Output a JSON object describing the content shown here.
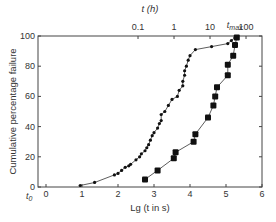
{
  "chart_data": {
    "type": "scatter",
    "title": "",
    "xlabel": "Lg (t in s)",
    "ylabel": "Cumulative percentage failure",
    "top_axis_label": "t (h)",
    "top_axis_ticks": [
      {
        "label": "0.1",
        "lg_s": 2.556
      },
      {
        "label": "1",
        "lg_s": 3.556
      },
      {
        "label": "10",
        "lg_s": 4.556
      },
      {
        "label": "100",
        "lg_s": 5.556
      }
    ],
    "annotations": [
      {
        "text": "t_max",
        "x": 5.3,
        "y": 100
      },
      {
        "text": "t_0",
        "x": 0,
        "y": 0
      }
    ],
    "xlim": [
      0,
      6
    ],
    "ylim": [
      0,
      100
    ],
    "x_ticks": [
      0,
      1,
      2,
      3,
      4,
      5,
      6
    ],
    "y_ticks": [
      0,
      20,
      40,
      60,
      80,
      100
    ],
    "grid": false,
    "legend": null,
    "series": [
      {
        "name": "small dots",
        "marker": "small-circle",
        "x": [
          0.95,
          1.35,
          1.9,
          2.0,
          2.1,
          2.2,
          2.3,
          2.35,
          2.5,
          2.6,
          2.65,
          2.75,
          2.8,
          2.85,
          2.9,
          2.95,
          3.0,
          3.1,
          3.15,
          3.2,
          3.2,
          3.3,
          3.4,
          3.5,
          3.65,
          3.7,
          3.8,
          3.8,
          3.85,
          3.85,
          3.9,
          3.95,
          4.0,
          4.15,
          4.6,
          5.05,
          5.15,
          5.25
        ],
        "y": [
          1,
          3,
          8,
          9,
          11,
          13,
          14,
          15,
          18,
          20,
          22,
          24,
          26,
          28,
          31,
          34,
          36,
          39,
          42,
          44,
          48,
          50,
          54,
          58,
          60,
          64,
          67,
          70,
          74,
          77,
          80,
          84,
          87,
          91,
          93,
          95,
          97,
          99
        ]
      },
      {
        "name": "large squares",
        "marker": "large-square",
        "x": [
          2.75,
          3.1,
          3.55,
          3.6,
          4.1,
          4.15,
          4.5,
          4.65,
          4.7,
          4.75,
          5.05,
          5.05,
          5.2,
          5.25,
          5.3
        ],
        "y": [
          5,
          11,
          19,
          23,
          30,
          35,
          46,
          54,
          60,
          66,
          74,
          81,
          87,
          94,
          99
        ]
      }
    ]
  }
}
